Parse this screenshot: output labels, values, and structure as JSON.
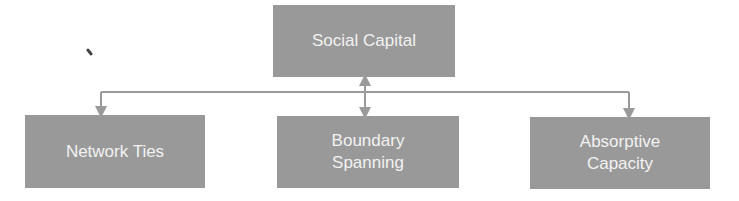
{
  "diagram": {
    "type": "hierarchy",
    "root": {
      "label": "Social Capital"
    },
    "children": [
      {
        "label_lines": [
          "Network Ties"
        ]
      },
      {
        "label_lines": [
          "Boundary",
          "Spanning"
        ]
      },
      {
        "label_lines": [
          "Absorptive",
          "Capacity"
        ]
      }
    ],
    "colors": {
      "box_fill": "#999999",
      "box_text": "#f2f2f2",
      "connector": "#9a9a9a",
      "background": "#ffffff"
    }
  }
}
